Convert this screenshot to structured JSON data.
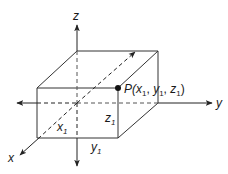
{
  "diagram": {
    "type": "3d-coordinate-box",
    "axes": {
      "x": {
        "label": "x"
      },
      "y": {
        "label": "y"
      },
      "z": {
        "label": "z"
      }
    },
    "point": {
      "name": "P",
      "label_prefix": "P(",
      "coords": [
        "x",
        "y",
        "z"
      ],
      "subscript": "1",
      "label_suffix": ")"
    },
    "dimension_labels": {
      "x1": {
        "base": "x",
        "sub": "1"
      },
      "y1": {
        "base": "y",
        "sub": "1"
      },
      "z1": {
        "base": "z",
        "sub": "1"
      }
    },
    "colors": {
      "line": "#333333",
      "dashed": "#555555",
      "point": "#111111",
      "text": "#1a1a1a"
    }
  }
}
